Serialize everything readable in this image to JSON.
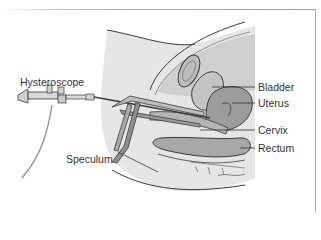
{
  "diagram": {
    "type": "anatomical-illustration",
    "labels": {
      "hysteroscope": "Hysteroscope",
      "speculum": "Speculum",
      "bladder": "Bladder",
      "uterus": "Uterus",
      "cervix": "Cervix",
      "rectum": "Rectum"
    },
    "colors": {
      "background": "#ffffff",
      "body_fill": "#e4e4e4",
      "organ_dark": "#9c9c9c",
      "organ_mid": "#bdbdbd",
      "organ_light": "#d4d4d4",
      "outline": "#3a3a3a",
      "label_text": "#333333"
    }
  }
}
